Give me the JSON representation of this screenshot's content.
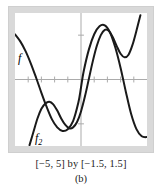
{
  "figure": {
    "caption_window": "[−5, 5] by [−1.5, 1.5]",
    "caption_part": "(b)",
    "frame_color": "#d9d9d9",
    "screen_background": "#ffffff",
    "curve_color": "#1a1a1a",
    "axis_color": "#aaaaaa"
  },
  "labels": {
    "f": "f",
    "f2_base": "f",
    "f2_sub": "2"
  },
  "chart_data": {
    "type": "line",
    "title": "",
    "xlabel": "",
    "ylabel": "",
    "xlim": [
      -5,
      5
    ],
    "ylim": [
      -1.5,
      1.5
    ],
    "grid": false,
    "legend": "inline-curve-labels",
    "axes": {
      "x_axis_at_y": 0,
      "y_axis_at_x": 0,
      "x_ticks": [
        -4,
        -3,
        -2,
        -1,
        1,
        2,
        3,
        4
      ],
      "y_ticks": [
        -1,
        1
      ],
      "tick_style": "small-crosshatch"
    },
    "series": [
      {
        "name": "f",
        "label": "f",
        "color": "#1a1a1a",
        "points": [
          [
            -5.0,
            1.02
          ],
          [
            -4.6,
            0.86
          ],
          [
            -4.2,
            0.64
          ],
          [
            -3.8,
            0.36
          ],
          [
            -3.4,
            0.04
          ],
          [
            -3.0,
            -0.3
          ],
          [
            -2.6,
            -0.62
          ],
          [
            -2.2,
            -0.9
          ],
          [
            -1.8,
            -1.08
          ],
          [
            -1.4,
            -1.16
          ],
          [
            -1.0,
            -1.12
          ],
          [
            -0.6,
            -0.94
          ],
          [
            -0.2,
            -0.52
          ],
          [
            0.0,
            -0.18
          ],
          [
            0.2,
            0.18
          ],
          [
            0.6,
            0.68
          ],
          [
            1.0,
            1.02
          ],
          [
            1.4,
            1.2
          ],
          [
            1.8,
            1.22
          ],
          [
            2.2,
            1.06
          ],
          [
            2.6,
            0.72
          ],
          [
            3.0,
            0.26
          ],
          [
            3.4,
            -0.28
          ],
          [
            3.8,
            -0.78
          ],
          [
            4.2,
            -1.12
          ],
          [
            4.6,
            -1.28
          ],
          [
            5.0,
            -1.3
          ]
        ]
      },
      {
        "name": "f2",
        "label": "f₂",
        "color": "#1a1a1a",
        "points": [
          [
            -3.9,
            -1.48
          ],
          [
            -3.6,
            -1.18
          ],
          [
            -3.3,
            -0.88
          ],
          [
            -3.0,
            -0.66
          ],
          [
            -2.7,
            -0.54
          ],
          [
            -2.4,
            -0.5
          ],
          [
            -2.1,
            -0.56
          ],
          [
            -1.8,
            -0.7
          ],
          [
            -1.5,
            -0.88
          ],
          [
            -1.2,
            -1.02
          ],
          [
            -0.9,
            -1.1
          ],
          [
            -0.6,
            -1.08
          ],
          [
            -0.3,
            -0.96
          ],
          [
            0.0,
            -0.72
          ],
          [
            0.3,
            -0.38
          ],
          [
            0.6,
            0.02
          ],
          [
            0.9,
            0.42
          ],
          [
            1.2,
            0.76
          ],
          [
            1.5,
            1.0
          ],
          [
            1.8,
            1.12
          ],
          [
            2.1,
            1.1
          ],
          [
            2.4,
            0.96
          ],
          [
            2.7,
            0.76
          ],
          [
            3.0,
            0.58
          ],
          [
            3.3,
            0.5
          ],
          [
            3.6,
            0.56
          ],
          [
            3.9,
            0.78
          ],
          [
            4.2,
            1.1
          ],
          [
            4.5,
            1.45
          ]
        ]
      }
    ]
  }
}
